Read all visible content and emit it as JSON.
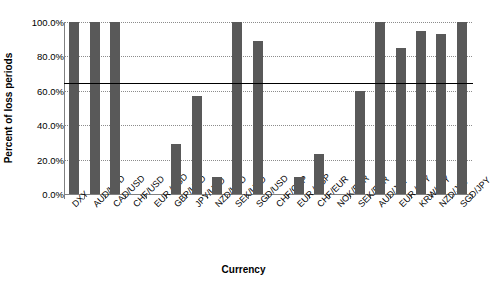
{
  "chart_data": {
    "type": "bar",
    "title": "",
    "xlabel": "Currency",
    "ylabel": "Percent of loss periods",
    "categories": [
      "DXY",
      "AUD/USD",
      "CAD/USD",
      "CHF/USD",
      "EUR /USD",
      "GBP/USD",
      "JPY/USD",
      "NZD/USD",
      "SEK/USD",
      "SGD/USD",
      "CHF/GBP",
      "EUR /GBP",
      "CHF/EUR",
      "NOK/EUR",
      "SEK/EUR",
      "AUD/JPY",
      "EUR /JPY",
      "KRW/JPY",
      "NZD/JPY",
      "SGD/JPY"
    ],
    "values": [
      100.0,
      100.0,
      100.0,
      0.0,
      0.0,
      29.0,
      57.0,
      10.0,
      100.0,
      89.0,
      0.0,
      10.0,
      23.0,
      0.0,
      60.0,
      100.0,
      85.0,
      95.0,
      93.0,
      100.0
    ],
    "ylim": [
      0,
      100
    ],
    "yticks": [
      "0.0%",
      "20.0%",
      "40.0%",
      "60.0%",
      "80.0%",
      "100.0%"
    ],
    "ytick_values": [
      0,
      20,
      40,
      60,
      80,
      100
    ],
    "grid": true,
    "legend": "none",
    "reference_line": {
      "value": 64.5,
      "label": ""
    },
    "bar_color": "#595959",
    "gridline_color": "#8c8c8c",
    "axis_color": "#808080",
    "reference_line_color": "#000000"
  }
}
